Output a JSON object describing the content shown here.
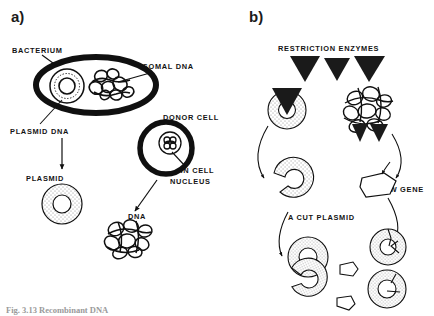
{
  "figure": {
    "background": "#ffffff",
    "ink": "#101010",
    "stipple": "#7d7d7d",
    "width": 434,
    "height": 316
  },
  "panels": [
    {
      "id": "a",
      "label": "a)"
    },
    {
      "id": "b",
      "label": "b)"
    }
  ],
  "panel_a": {
    "labels": {
      "bacterium": "BACTERIUM",
      "chromosomal_dna": "CHROMOSOMAL DNA",
      "plasmid_dna": "PLASMID DNA",
      "plasmid": "PLASMID",
      "donor_cell": "DONOR CELL",
      "dna_in_cell_nucleus_line1": "DNA IN CELL",
      "dna_in_cell_nucleus_line2": "NUCLEUS",
      "dna": "DNA"
    }
  },
  "panel_b": {
    "labels": {
      "restriction_enzymes": "RESTRICTION ENZYMES",
      "new_gene": "NEW GENE",
      "a_cut_plasmid": "A CUT PLASMID"
    },
    "enzyme_count": 3
  },
  "caption": {
    "text": "Fig. 3.13 Recombinant DNA"
  }
}
